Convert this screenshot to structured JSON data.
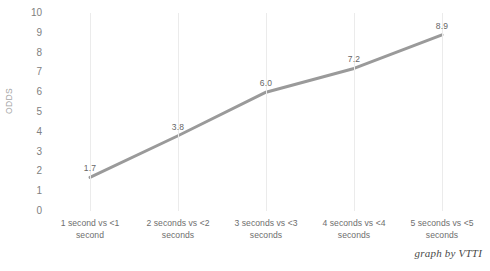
{
  "chart_data": {
    "type": "line",
    "title": "",
    "subtitle": "",
    "xlabel": "",
    "ylabel": "ODDS",
    "ylim": [
      0,
      10
    ],
    "ytick_step": 1,
    "grid": {
      "horizontal": false,
      "vertical": true
    },
    "legend": {
      "visible": false,
      "position": "none"
    },
    "categories": [
      "1 second vs <1 second",
      "2 seconds vs <2 seconds",
      "3 seconds vs <3 seconds",
      "4 seconds vs <4 seconds",
      "5 seconds vs <5 seconds"
    ],
    "category_lines": [
      [
        "1 second vs  <1",
        "second"
      ],
      [
        "2 seconds vs  <2",
        "seconds"
      ],
      [
        "3 seconds vs  <3",
        "seconds"
      ],
      [
        "4 seconds vs  <4",
        "seconds"
      ],
      [
        "5 seconds vs  <5",
        "seconds"
      ]
    ],
    "values": [
      1.7,
      3.8,
      6.0,
      7.2,
      8.9
    ],
    "data_labels": [
      "1.7",
      "3.8",
      "6.0",
      "7.2",
      "8.9"
    ],
    "ytick_labels": [
      "10",
      "9",
      "8",
      "7",
      "6",
      "5",
      "4",
      "3",
      "2",
      "1",
      "0"
    ],
    "series": [
      {
        "name": "ODDS",
        "values": [
          1.7,
          3.8,
          6.0,
          7.2,
          8.9
        ],
        "color": "#9a9a9a",
        "line_width": 3,
        "markers": false
      }
    ]
  },
  "annotations": {
    "credit": "graph by VTTI"
  },
  "colors": {
    "series_line": "#9a9a9a",
    "gridline": "#ebebeb",
    "tick_text": "#808080",
    "axis_title": "#a6a6a6",
    "data_label": "#666666",
    "background": "#ffffff"
  }
}
